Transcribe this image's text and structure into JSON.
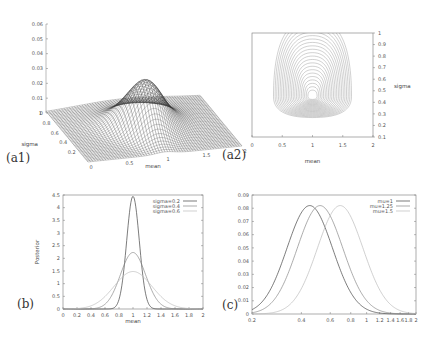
{
  "panels": {
    "a1": "(a1)",
    "a2": "(a2)",
    "b": "(b)",
    "c": "(c)"
  },
  "chart_data": [
    {
      "id": "a1",
      "type": "surface3d",
      "title": "",
      "xlabel": "mean",
      "ylabel": "sigma",
      "zlabel": "",
      "x_ticks": [
        "0",
        "0.5",
        "1",
        "1.5",
        "2"
      ],
      "y_ticks": [
        "0.2",
        "0.4",
        "0.6",
        "0.8",
        "1"
      ],
      "z_ticks": [
        "0",
        "0.01",
        "0.02",
        "0.03",
        "0.04",
        "0.05",
        "0.06"
      ],
      "xlim": [
        0,
        2
      ],
      "ylim": [
        0,
        1
      ],
      "zlim": [
        0,
        0.06
      ],
      "peak": {
        "mean": 1,
        "sigma": 0.45,
        "value": 0.033
      }
    },
    {
      "id": "a2",
      "type": "contour",
      "title": "",
      "xlabel": "mean",
      "ylabel": "sigma",
      "x_ticks": [
        "0",
        "0.5",
        "1",
        "1.5",
        "2"
      ],
      "y_ticks": [
        "0.1",
        "0.2",
        "0.3",
        "0.4",
        "0.5",
        "0.6",
        "0.7",
        "0.8",
        "0.9",
        "1"
      ],
      "xlim": [
        0,
        2
      ],
      "ylim": [
        0.1,
        1
      ],
      "center": {
        "mean": 1,
        "sigma": 0.45
      }
    },
    {
      "id": "b",
      "type": "line",
      "title": "",
      "xlabel": "mean",
      "ylabel": "Posterior",
      "x_ticks": [
        "0",
        "0.2",
        "0.4",
        "0.6",
        "0.8",
        "1",
        "1.2",
        "1.4",
        "1.6",
        "1.8",
        "2"
      ],
      "y_ticks": [
        "0",
        "0.5",
        "1",
        "1.5",
        "2",
        "2.5",
        "3",
        "3.5",
        "4",
        "4.5"
      ],
      "xlim": [
        0,
        2
      ],
      "ylim": [
        0,
        4.5
      ],
      "legend_position": "top-right",
      "series": [
        {
          "name": "sigma=0.2",
          "mu": 1,
          "sd": 0.09,
          "peak": 4.45
        },
        {
          "name": "sigma=0.4",
          "mu": 1,
          "sd": 0.18,
          "peak": 2.23
        },
        {
          "name": "sigma=0.6",
          "mu": 1,
          "sd": 0.27,
          "peak": 1.48
        }
      ]
    },
    {
      "id": "c",
      "type": "line",
      "title": "",
      "xlabel": "",
      "ylabel": "",
      "x_scale": "log",
      "x_ticks": [
        "0.2",
        "0.4",
        "0.6",
        "0.8",
        "1",
        "1.2",
        "1.4",
        "1.6",
        "1.8",
        "2"
      ],
      "y_ticks": [
        "0",
        "0.01",
        "0.02",
        "0.03",
        "0.04",
        "0.05",
        "0.06",
        "0.07",
        "0.08",
        "0.09"
      ],
      "xlim": [
        0.2,
        2
      ],
      "ylim": [
        0,
        0.09
      ],
      "legend_position": "top-right",
      "series": [
        {
          "name": "mu=1",
          "peak_x": 0.45,
          "peak": 0.082
        },
        {
          "name": "mu=1.25",
          "peak_x": 0.52,
          "peak": 0.082
        },
        {
          "name": "mu=1.5",
          "peak_x": 0.69,
          "peak": 0.082
        }
      ]
    }
  ]
}
